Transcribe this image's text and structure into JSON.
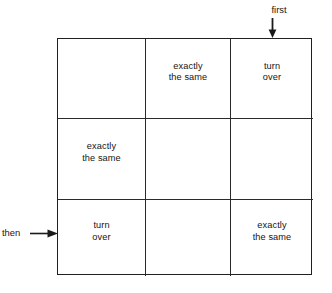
{
  "diagram": {
    "type": "3x3-grid-diagram",
    "grid": {
      "rows": 3,
      "columns": 3,
      "cells": [
        [
          {
            "text": "",
            "empty": true
          },
          {
            "text": "exactly\nthe same",
            "empty": false
          },
          {
            "text": "turn\nover",
            "empty": false
          }
        ],
        [
          {
            "text": "exactly\nthe same",
            "empty": false
          },
          {
            "text": "",
            "empty": true
          },
          {
            "text": "",
            "empty": true
          }
        ],
        [
          {
            "text": "turn\nover",
            "empty": false
          },
          {
            "text": "",
            "empty": true
          },
          {
            "text": "exactly\nthe same",
            "empty": false
          }
        ]
      ]
    },
    "annotations": {
      "top": {
        "label": "first",
        "icon": "arrow-down-icon",
        "points_to": "column-3"
      },
      "left": {
        "label": "then",
        "icon": "arrow-right-icon",
        "points_to": "row-3"
      }
    },
    "colors": {
      "background": "#ffffff",
      "line": "#202020",
      "text": "#141414"
    }
  }
}
